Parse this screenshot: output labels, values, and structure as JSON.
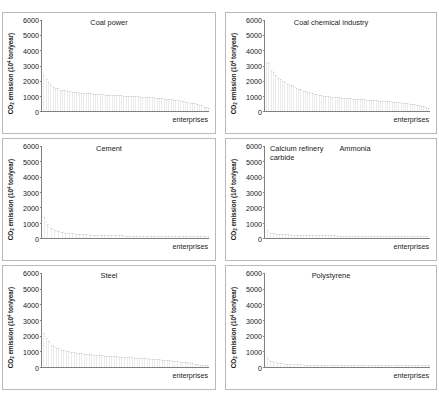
{
  "figure": {
    "background": "#ffffff",
    "bar_color": "#eceaea",
    "axis_color": "#808080",
    "panel_border_color": "#b9b9b9",
    "y_axis_title_prefix": "CO",
    "y_axis_title_sub": "2",
    "y_axis_title_mid": " emission (10",
    "y_axis_title_sup": "4",
    "y_axis_title_suffix": " ton/year)",
    "x_axis_title": "enterprises",
    "y_ticks": [
      "0",
      "1000",
      "2000",
      "3000",
      "4000",
      "5000",
      "6000"
    ],
    "caption_ghost": ""
  },
  "chart_data": [
    {
      "type": "bar",
      "title": "Coal power",
      "panel_index": 0,
      "label_position": "center",
      "xlabel": "enterprises",
      "ylabel": "CO2 emission (10^4 ton/year)",
      "ylim": [
        0,
        6000
      ],
      "yticks": [
        0,
        1000,
        2000,
        3000,
        4000,
        5000,
        6000
      ],
      "grid": false,
      "legend": "none",
      "n_enterprises": 96,
      "values": [
        2330,
        2180,
        2040,
        1860,
        1720,
        1610,
        1540,
        1480,
        1430,
        1390,
        1350,
        1320,
        1295,
        1270,
        1250,
        1230,
        1215,
        1200,
        1185,
        1170,
        1160,
        1148,
        1138,
        1128,
        1118,
        1108,
        1098,
        1090,
        1082,
        1074,
        1066,
        1058,
        1050,
        1043,
        1036,
        1029,
        1022,
        1015,
        1008,
        1001,
        995,
        988,
        982,
        975,
        969,
        962,
        956,
        950,
        943,
        937,
        930,
        924,
        917,
        910,
        903,
        896,
        889,
        881,
        873,
        865,
        857,
        848,
        839,
        830,
        820,
        810,
        800,
        789,
        778,
        766,
        754,
        741,
        728,
        714,
        700,
        685,
        669,
        652,
        635,
        617,
        598,
        578,
        557,
        535,
        512,
        488,
        462,
        435,
        406,
        375,
        342,
        306,
        267,
        224,
        175,
        118
      ]
    },
    {
      "type": "bar",
      "title": "Coal chemical industry",
      "panel_index": 1,
      "label_position": "center",
      "xlabel": "enterprises",
      "ylabel": "CO2 emission (10^4 ton/year)",
      "ylim": [
        0,
        6000
      ],
      "yticks": [
        0,
        1000,
        2000,
        3000,
        4000,
        5000,
        6000
      ],
      "grid": false,
      "legend": "none",
      "n_enterprises": 92,
      "values": [
        3180,
        3080,
        2890,
        2660,
        2480,
        2330,
        2210,
        2110,
        2020,
        1940,
        1870,
        1800,
        1740,
        1680,
        1620,
        1565,
        1510,
        1460,
        1410,
        1360,
        1315,
        1270,
        1230,
        1190,
        1155,
        1120,
        1090,
        1062,
        1036,
        1012,
        990,
        970,
        952,
        936,
        920,
        905,
        891,
        878,
        865,
        853,
        841,
        830,
        819,
        808,
        798,
        788,
        778,
        768,
        758,
        749,
        740,
        731,
        722,
        713,
        704,
        696,
        687,
        678,
        670,
        661,
        652,
        643,
        634,
        625,
        616,
        606,
        597,
        587,
        577,
        567,
        556,
        545,
        534,
        522,
        510,
        497,
        484,
        470,
        456,
        441,
        425,
        408,
        390,
        371,
        351,
        329,
        306,
        281,
        253,
        222,
        186,
        142
      ]
    },
    {
      "type": "bar",
      "title": "Cement",
      "panel_index": 2,
      "label_position": "center",
      "xlabel": "enterprises",
      "ylabel": "CO2 emission (10^4 ton/year)",
      "ylim": [
        0,
        6000
      ],
      "yticks": [
        0,
        1000,
        2000,
        3000,
        4000,
        5000,
        6000
      ],
      "grid": false,
      "legend": "none",
      "n_enterprises": 120,
      "values": [
        1860,
        1320,
        1010,
        830,
        710,
        625,
        560,
        508,
        466,
        431,
        401,
        376,
        354,
        334,
        317,
        301,
        287,
        274,
        263,
        252,
        242,
        233,
        225,
        217,
        210,
        203,
        197,
        191,
        185,
        180,
        175,
        170,
        166,
        162,
        158,
        154,
        150,
        147,
        143,
        140,
        137,
        134,
        131,
        129,
        126,
        124,
        121,
        119,
        117,
        114,
        112,
        110,
        108,
        106,
        104,
        103,
        101,
        99,
        97,
        96,
        94,
        92,
        91,
        89,
        88,
        86,
        85,
        84,
        82,
        81,
        80,
        78,
        77,
        76,
        75,
        73,
        72,
        71,
        70,
        69,
        68,
        66,
        65,
        64,
        63,
        62,
        61,
        60,
        59,
        58,
        57,
        56,
        55,
        54,
        53,
        52,
        51,
        50,
        49,
        48,
        47,
        46,
        45,
        44,
        43,
        42,
        41,
        40,
        38,
        37,
        36,
        35,
        33,
        32,
        30,
        28,
        26,
        24,
        21,
        17
      ]
    },
    {
      "type": "bar",
      "title": "Calcium refinery\ncarbide",
      "title_secondary": "Ammonia",
      "panel_index": 3,
      "label_position": "split",
      "xlabel": "enterprises",
      "ylabel": "CO2 emission (10^4 ton/year)",
      "ylim": [
        0,
        6000
      ],
      "yticks": [
        0,
        1000,
        2000,
        3000,
        4000,
        5000,
        6000
      ],
      "grid": false,
      "legend": "none",
      "n_enterprises": 110,
      "values": [
        760,
        430,
        330,
        288,
        262,
        244,
        230,
        219,
        209,
        201,
        194,
        188,
        182,
        177,
        172,
        168,
        164,
        160,
        157,
        153,
        150,
        147,
        144,
        142,
        139,
        137,
        134,
        132,
        130,
        128,
        126,
        124,
        122,
        120,
        118,
        117,
        115,
        113,
        112,
        110,
        109,
        107,
        106,
        104,
        103,
        102,
        100,
        99,
        98,
        96,
        95,
        94,
        93,
        92,
        90,
        89,
        88,
        87,
        86,
        85,
        84,
        83,
        82,
        81,
        80,
        79,
        78,
        77,
        76,
        75,
        74,
        73,
        72,
        71,
        70,
        69,
        68,
        67,
        66,
        65,
        64,
        63,
        62,
        61,
        60,
        59,
        58,
        57,
        56,
        55,
        54,
        52,
        51,
        50,
        49,
        47,
        46,
        45,
        43,
        42,
        40,
        39,
        37,
        35,
        33,
        31,
        29,
        26,
        23,
        19
      ]
    },
    {
      "type": "bar",
      "title": "Steel",
      "panel_index": 4,
      "label_position": "center",
      "xlabel": "enterprises",
      "ylabel": "CO2 emission (10^4 ton/year)",
      "ylim": [
        0,
        6000
      ],
      "yticks": [
        0,
        1000,
        2000,
        3000,
        4000,
        5000,
        6000
      ],
      "grid": false,
      "legend": "none",
      "n_enterprises": 100,
      "values": [
        2120,
        1940,
        1760,
        1600,
        1470,
        1370,
        1290,
        1225,
        1170,
        1125,
        1085,
        1050,
        1020,
        992,
        967,
        944,
        923,
        903,
        885,
        868,
        852,
        837,
        823,
        810,
        797,
        785,
        773,
        762,
        751,
        741,
        731,
        721,
        712,
        703,
        694,
        686,
        677,
        669,
        661,
        653,
        646,
        638,
        631,
        623,
        616,
        609,
        602,
        595,
        588,
        581,
        574,
        567,
        560,
        553,
        546,
        539,
        532,
        525,
        518,
        511,
        503,
        496,
        488,
        481,
        473,
        465,
        457,
        449,
        440,
        432,
        423,
        414,
        405,
        395,
        386,
        376,
        365,
        355,
        344,
        332,
        321,
        308,
        296,
        283,
        269,
        255,
        240,
        225,
        209,
        192,
        174,
        156,
        136,
        116,
        95,
        74,
        56,
        40,
        26,
        14
      ]
    },
    {
      "type": "bar",
      "title": "Polystyrene",
      "panel_index": 5,
      "label_position": "center",
      "xlabel": "enterprises",
      "ylabel": "CO2 emission (10^4 ton/year)",
      "ylim": [
        0,
        6000
      ],
      "yticks": [
        0,
        1000,
        2000,
        3000,
        4000,
        5000,
        6000
      ],
      "grid": false,
      "legend": "none",
      "n_enterprises": 115,
      "values": [
        620,
        480,
        395,
        340,
        300,
        270,
        246,
        226,
        209,
        195,
        183,
        172,
        163,
        155,
        147,
        141,
        135,
        129,
        124,
        119,
        115,
        111,
        107,
        104,
        100,
        97,
        94,
        92,
        89,
        87,
        84,
        82,
        80,
        78,
        76,
        74,
        73,
        71,
        69,
        68,
        66,
        65,
        63,
        62,
        61,
        59,
        58,
        57,
        56,
        55,
        54,
        52,
        51,
        50,
        49,
        48,
        47,
        46,
        46,
        45,
        44,
        43,
        42,
        41,
        40,
        40,
        39,
        38,
        37,
        36,
        36,
        35,
        34,
        33,
        33,
        32,
        31,
        30,
        30,
        29,
        28,
        28,
        27,
        26,
        26,
        25,
        24,
        24,
        23,
        22,
        22,
        21,
        20,
        20,
        19,
        18,
        18,
        17,
        16,
        16,
        15,
        14,
        14,
        13,
        12,
        11,
        11,
        10,
        9,
        8,
        7,
        6,
        5,
        4,
        3
      ]
    }
  ]
}
